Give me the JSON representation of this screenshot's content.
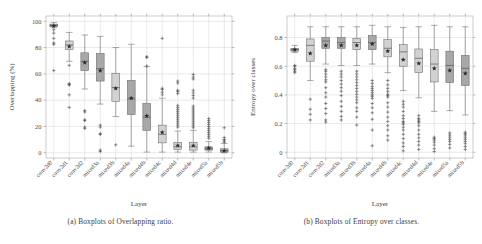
{
  "figure": {
    "panels": [
      {
        "id": "panel-a",
        "caption": "(a) Boxplots of Overlapping ratio.",
        "xlabel": "Layer",
        "ylabel": "Overlapping (%)"
      },
      {
        "id": "panel-b",
        "caption": "(b) Boxplots of Entropy over classes.",
        "xlabel": "Layer",
        "ylabel": "Entropy over classes"
      }
    ]
  },
  "colors": {
    "box_fill_dark": "#a8a8a8",
    "box_fill_light": "#d2d2d2",
    "box_stroke": "#5c5c5c",
    "grid": "#c9c9c9",
    "axis": "#9a9a9a",
    "marker": "#2a2a2a",
    "text": "#3c3c3c"
  },
  "chart_data": [
    {
      "type": "box",
      "title": "(a) Boxplots of Overlapping ratio.",
      "xlabel": "Layer",
      "ylabel": "Overlapping (%)",
      "ylim": [
        -4,
        104
      ],
      "yticks": [
        0,
        20,
        40,
        60,
        80,
        100
      ],
      "ytick_labels": [
        "0",
        "20",
        "40",
        "60",
        "80",
        "100"
      ],
      "grid": true,
      "legend": "none",
      "categories": [
        "conv2d0",
        "conv2d1",
        "conv2d2",
        "mixed3a",
        "mixed3b",
        "mixed4a",
        "mixed4b",
        "mixed4c",
        "mixed4d",
        "mixed4e",
        "mixed5a",
        "mixed5b"
      ],
      "boxes": [
        {
          "label": "conv2d0",
          "whisker_low": 95.0,
          "q1": 95.8,
          "median": 96.8,
          "q3": 97.8,
          "whisker_high": 99.0,
          "mean": 96.5,
          "fill": "dark",
          "outliers": [
            93.5,
            91.0,
            87.0,
            83.5,
            82.5,
            62.5
          ]
        },
        {
          "label": "conv2d1",
          "whisker_low": 69.5,
          "q1": 78.5,
          "median": 82.0,
          "q3": 85.0,
          "whisker_high": 91.5,
          "mean": 80.8,
          "fill": "light",
          "outliers": [
            66.5,
            52.5,
            52.0,
            51.5,
            44.0,
            34.5
          ]
        },
        {
          "label": "conv2d2",
          "whisker_low": 48.5,
          "q1": 62.5,
          "median": 69.5,
          "q3": 76.0,
          "whisker_high": 89.5,
          "mean": 68.5,
          "fill": "dark",
          "outliers": [
            32.0,
            31.0,
            25.0,
            24.5,
            19.5,
            18.5
          ]
        },
        {
          "label": "mixed3a",
          "whisker_low": 37.0,
          "q1": 54.5,
          "median": 64.0,
          "q3": 75.5,
          "whisker_high": 88.5,
          "mean": 62.5,
          "fill": "dark",
          "outliers": [
            21.0,
            19.5,
            14.5,
            14.0,
            2.0,
            1.0
          ]
        },
        {
          "label": "mixed3b",
          "whisker_low": 27.5,
          "q1": 39.0,
          "median": 49.5,
          "q3": 60.5,
          "whisker_high": 80.0,
          "mean": 49.0,
          "fill": "light",
          "outliers": [
            6.0
          ]
        },
        {
          "label": "mixed4a",
          "whisker_low": 5.0,
          "q1": 29.0,
          "median": 41.0,
          "q3": 55.0,
          "whisker_high": 82.5,
          "mean": 41.5,
          "fill": "dark",
          "outliers": []
        },
        {
          "label": "mixed4b",
          "whisker_low": 0.5,
          "q1": 17.0,
          "median": 27.0,
          "q3": 37.5,
          "whisker_high": 65.5,
          "mean": 28.0,
          "fill": "dark",
          "outliers": [
            73.0,
            72.5,
            66.0
          ]
        },
        {
          "label": "mixed4c",
          "whisker_low": 0.5,
          "q1": 7.5,
          "median": 14.0,
          "q3": 21.0,
          "whisker_high": 41.5,
          "mean": 15.5,
          "fill": "light",
          "outliers": [
            87.0,
            49.0,
            48.0,
            46.0,
            44.0
          ]
        },
        {
          "label": "mixed4d",
          "whisker_low": 0.5,
          "q1": 2.5,
          "median": 4.5,
          "q3": 8.0,
          "whisker_high": 16.5,
          "mean": 5.5,
          "fill": "light",
          "outliers": [
            54.5,
            53.0,
            47.5,
            46.5,
            45.0,
            36.0,
            34.5,
            33.0,
            31.5,
            30.0,
            28.5,
            27.0,
            25.5,
            24.0,
            22.5,
            21.0,
            19.5
          ]
        },
        {
          "label": "mixed4e",
          "whisker_low": 0.5,
          "q1": 2.0,
          "median": 4.5,
          "q3": 8.0,
          "whisker_high": 17.0,
          "mean": 5.5,
          "fill": "light",
          "outliers": [
            59.5,
            57.5,
            56.0,
            47.5,
            45.5,
            43.5,
            41.5,
            35.5,
            34.0,
            32.5,
            31.0,
            29.5,
            28.0,
            26.5,
            25.0,
            23.5,
            22.0,
            20.5,
            19.0
          ]
        },
        {
          "label": "mixed5a",
          "whisker_low": 0.5,
          "q1": 2.0,
          "median": 3.0,
          "q3": 4.5,
          "whisker_high": 8.5,
          "mean": 3.5,
          "fill": "dark",
          "outliers": [
            26.0,
            24.5,
            23.0,
            21.5,
            20.0,
            18.5,
            17.0,
            15.5,
            14.0,
            12.5,
            11.0
          ]
        },
        {
          "label": "mixed5b",
          "whisker_low": 0.0,
          "q1": 0.5,
          "median": 1.5,
          "q3": 3.0,
          "whisker_high": 7.0,
          "mean": 1.5,
          "fill": "dark",
          "outliers": [
            19.0,
            11.5,
            10.0,
            9.0,
            8.0
          ]
        }
      ]
    },
    {
      "type": "box",
      "title": "(b) Boxplots of Entropy over classes.",
      "xlabel": "Layer",
      "ylabel": "Entropy over classes",
      "ylim": [
        -0.04,
        0.95
      ],
      "yticks": [
        0,
        0.2,
        0.4,
        0.6,
        0.8
      ],
      "ytick_labels": [
        "0",
        "0.2",
        "0.4",
        "0.6",
        "0.8"
      ],
      "grid": true,
      "legend": "none",
      "categories": [
        "conv2d0",
        "conv2d1",
        "conv2d2",
        "mixed3a",
        "mixed3b",
        "mixed4a",
        "mixed4b",
        "mixed4c",
        "mixed4d",
        "mixed4e",
        "mixed5a",
        "mixed5b"
      ],
      "boxes": [
        {
          "label": "conv2d0",
          "whisker_low": 0.695,
          "q1": 0.705,
          "median": 0.715,
          "q3": 0.725,
          "whisker_high": 0.745,
          "mean": 0.715,
          "fill": "dark",
          "outliers": [
            0.605,
            0.6,
            0.585,
            0.575,
            0.565,
            0.555
          ]
        },
        {
          "label": "conv2d1",
          "whisker_low": 0.5,
          "q1": 0.635,
          "median": 0.745,
          "q3": 0.79,
          "whisker_high": 0.875,
          "mean": 0.69,
          "fill": "light",
          "outliers": [
            0.37,
            0.3,
            0.265,
            0.225
          ]
        },
        {
          "label": "conv2d2",
          "whisker_low": 0.615,
          "q1": 0.725,
          "median": 0.775,
          "q3": 0.8,
          "whisker_high": 0.875,
          "mean": 0.745,
          "fill": "dark",
          "outliers": [
            0.575,
            0.565,
            0.545,
            0.525,
            0.505,
            0.49,
            0.45,
            0.415,
            0.385,
            0.34,
            0.305,
            0.27,
            0.225,
            0.21
          ]
        },
        {
          "label": "mixed3a",
          "whisker_low": 0.605,
          "q1": 0.725,
          "median": 0.765,
          "q3": 0.8,
          "whisker_high": 0.875,
          "mean": 0.745,
          "fill": "dark",
          "outliers": [
            0.565,
            0.545,
            0.525,
            0.5,
            0.475,
            0.45,
            0.425,
            0.395,
            0.355,
            0.32,
            0.285,
            0.25,
            0.225
          ]
        },
        {
          "label": "mixed3b",
          "whisker_low": 0.605,
          "q1": 0.715,
          "median": 0.765,
          "q3": 0.795,
          "whisker_high": 0.875,
          "mean": 0.745,
          "fill": "light",
          "outliers": [
            0.565,
            0.545,
            0.525,
            0.505,
            0.485,
            0.465,
            0.445,
            0.425,
            0.405,
            0.385,
            0.365,
            0.345,
            0.31,
            0.285,
            0.245,
            0.19
          ]
        },
        {
          "label": "mixed4a",
          "whisker_low": 0.615,
          "q1": 0.715,
          "median": 0.765,
          "q3": 0.815,
          "whisker_high": 0.885,
          "mean": 0.755,
          "fill": "dark",
          "outliers": [
            0.5,
            0.48,
            0.46,
            0.445,
            0.43,
            0.415,
            0.4,
            0.39,
            0.375,
            0.34,
            0.31,
            0.275,
            0.23,
            0.155,
            0.045
          ]
        },
        {
          "label": "mixed4b",
          "whisker_low": 0.555,
          "q1": 0.665,
          "median": 0.725,
          "q3": 0.785,
          "whisker_high": 0.875,
          "mean": 0.705,
          "fill": "light",
          "outliers": [
            0.5,
            0.47,
            0.445,
            0.425,
            0.405,
            0.395,
            0.385,
            0.345,
            0.315,
            0.28,
            0.245,
            0.215,
            0.185,
            0.155,
            0.115,
            0.085
          ]
        },
        {
          "label": "mixed4c",
          "whisker_low": 0.43,
          "q1": 0.6,
          "median": 0.7,
          "q3": 0.75,
          "whisker_high": 0.87,
          "mean": 0.645,
          "fill": "light",
          "outliers": [
            0.355,
            0.335,
            0.315,
            0.285,
            0.255,
            0.235,
            0.215,
            0.205,
            0.195,
            0.175,
            0.155,
            0.125,
            0.095,
            0.065,
            0.04,
            0.01
          ]
        },
        {
          "label": "mixed4d",
          "whisker_low": 0.38,
          "q1": 0.555,
          "median": 0.655,
          "q3": 0.72,
          "whisker_high": 0.875,
          "mean": 0.62,
          "fill": "light",
          "outliers": [
            0.255,
            0.235,
            0.225,
            0.215,
            0.205,
            0.185,
            0.155,
            0.125,
            0.1,
            0.075,
            0.05,
            0.02
          ]
        },
        {
          "label": "mixed4e",
          "whisker_low": 0.285,
          "q1": 0.49,
          "median": 0.615,
          "q3": 0.715,
          "whisker_high": 0.885,
          "mean": 0.585,
          "fill": "light",
          "outliers": [
            0.105,
            0.095,
            0.085,
            0.07,
            0.05,
            0.025,
            0.005
          ]
        },
        {
          "label": "mixed5a",
          "whisker_low": 0.29,
          "q1": 0.485,
          "median": 0.605,
          "q3": 0.705,
          "whisker_high": 0.875,
          "mean": 0.57,
          "fill": "dark",
          "outliers": [
            0.135,
            0.12,
            0.105,
            0.09,
            0.075,
            0.055,
            0.03
          ]
        },
        {
          "label": "mixed5b",
          "whisker_low": 0.26,
          "q1": 0.465,
          "median": 0.585,
          "q3": 0.675,
          "whisker_high": 0.875,
          "mean": 0.55,
          "fill": "dark",
          "outliers": [
            0.14,
            0.13,
            0.12,
            0.105,
            0.09,
            0.075,
            0.06,
            0.04,
            0.02
          ]
        }
      ]
    }
  ]
}
